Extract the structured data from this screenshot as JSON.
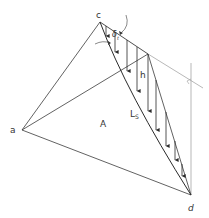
{
  "diagram": {
    "type": "geotechnical-wedge-diagram",
    "stroke_color": "#3a3a3a",
    "light_stroke_color": "#9a9a9a",
    "labels": {
      "point_c": "c",
      "point_a": "a",
      "point_d": "d",
      "area": "A",
      "height": "h",
      "length_main": "L",
      "length_sub": "S",
      "angle_main": "δ",
      "angle_sub": "t"
    },
    "points": {
      "c": [
        100,
        22
      ],
      "a": [
        22,
        130
      ],
      "d": [
        191,
        195
      ],
      "b": [
        148,
        54
      ],
      "ext_end": [
        203,
        88
      ]
    },
    "arrows_count": 8
  }
}
